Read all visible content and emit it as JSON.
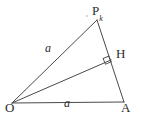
{
  "figure": {
    "type": "geometry-diagram",
    "background_color": "#ffffff",
    "stroke_color": "#4a4a4a",
    "label_color": "#2b2b2b",
    "width": 142,
    "height": 119,
    "vertices": [
      {
        "id": "P",
        "label": "P",
        "subscript": "k",
        "x": 97,
        "y": 20
      },
      {
        "id": "H",
        "label": "H",
        "subscript": "",
        "x": 110,
        "y": 59
      },
      {
        "id": "O",
        "label": "O",
        "subscript": "",
        "x": 12,
        "y": 103
      },
      {
        "id": "A",
        "label": "A",
        "subscript": "",
        "x": 124,
        "y": 102
      }
    ],
    "segments": [
      {
        "id": "OP",
        "from": "O",
        "to": "P"
      },
      {
        "id": "PA",
        "from": "P",
        "to": "A"
      },
      {
        "id": "OA",
        "from": "O",
        "to": "A"
      },
      {
        "id": "OH",
        "from": "O",
        "to": "H"
      }
    ],
    "side_labels": [
      {
        "id": "a-left",
        "text": "a",
        "on_segment": "OP",
        "x": 45,
        "y": 42
      },
      {
        "id": "a-bottom",
        "text": "a",
        "on_segment": "OA",
        "x": 64,
        "y": 97
      }
    ],
    "markers": [
      {
        "id": "right-angle-H",
        "type": "right-angle-square",
        "at": "H",
        "size": 6
      }
    ]
  }
}
